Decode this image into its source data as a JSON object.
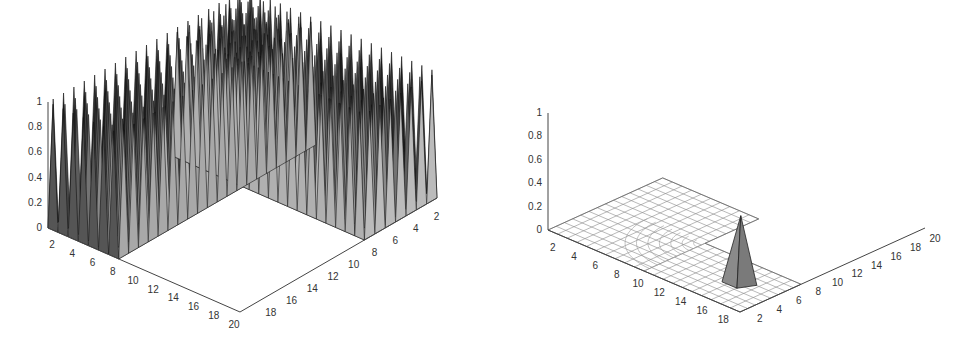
{
  "chart_data": [
    {
      "type": "surface3d",
      "title": "",
      "description": "3D surface: dense array of pyramid spikes of height 1 along two perpendicular walls (L-shaped region) of a 20x20 grid; interior floor at 0",
      "xlabel": "",
      "ylabel": "",
      "zlabel": "",
      "z_ticks": [
        "0",
        "0.2",
        "0.4",
        "0.6",
        "0.8",
        "1"
      ],
      "x_ticks": [
        "2",
        "4",
        "6",
        "8",
        "10",
        "12",
        "14",
        "16",
        "18",
        "20"
      ],
      "y_ticks": [
        "18",
        "16",
        "14",
        "12",
        "10",
        "8",
        "6",
        "4",
        "2"
      ],
      "zlim": [
        0,
        1
      ],
      "xlim": [
        1,
        20
      ],
      "ylim": [
        1,
        20
      ],
      "peak_value": 1,
      "wall_width": 7,
      "colors": {
        "face": "#a0a0a0",
        "edge": "#111111",
        "floor": "#ffffff"
      }
    },
    {
      "type": "surface3d",
      "title": "",
      "description": "3D mesh: L-shaped flat grid region at z=0 with curved (circular) contour lines at the corner; single pyramid peak of height ~0.5 near x=16, y=4",
      "xlabel": "",
      "ylabel": "",
      "zlabel": "",
      "z_ticks": [
        "0",
        "0.2",
        "0.4",
        "0.6",
        "0.8",
        "1"
      ],
      "x_ticks": [
        "2",
        "4",
        "6",
        "8",
        "10",
        "12",
        "14",
        "16",
        "18"
      ],
      "y_ticks": [
        "2",
        "4",
        "6",
        "8",
        "10",
        "12",
        "14",
        "16",
        "18",
        "20"
      ],
      "zlim": [
        0,
        1
      ],
      "xlim": [
        1,
        19
      ],
      "ylim": [
        1,
        20
      ],
      "peak": {
        "x": 16,
        "y": 4,
        "z": 0.5
      },
      "colors": {
        "mesh": "#777777",
        "peak_face": "#888888",
        "peak_edge": "#222222"
      }
    }
  ]
}
